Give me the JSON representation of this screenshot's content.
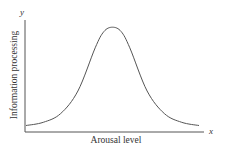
{
  "chart_data": {
    "type": "line",
    "title": "",
    "xlabel": "Arousal level",
    "ylabel": "Information processing",
    "x_axis_symbol": "x",
    "y_axis_symbol": "y",
    "grid": false,
    "legend": null,
    "ticks": false,
    "xlim": [
      0,
      1
    ],
    "ylim": [
      0,
      1
    ],
    "series": [
      {
        "name": "Information processing",
        "x": [
          0.0,
          0.1,
          0.2,
          0.3,
          0.4,
          0.45,
          0.5,
          0.55,
          0.6,
          0.7,
          0.8,
          0.9,
          1.0
        ],
        "values": [
          0.06,
          0.09,
          0.17,
          0.38,
          0.78,
          0.93,
          0.97,
          0.93,
          0.78,
          0.38,
          0.17,
          0.09,
          0.06
        ]
      }
    ],
    "colors": {
      "curve": "#555555",
      "axes": "#555555",
      "text": "#333333"
    }
  }
}
